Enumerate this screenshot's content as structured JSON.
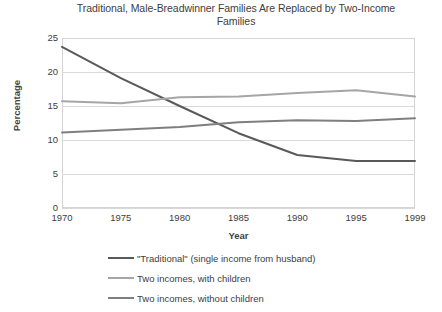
{
  "chart_data": {
    "type": "line",
    "title": "Traditional, Male-Breadwinner Families Are Replaced by Two-Income Families",
    "xlabel": "Year",
    "ylabel": "Percentage",
    "categories": [
      "1970",
      "1975",
      "1980",
      "1985",
      "1990",
      "1995",
      "1999"
    ],
    "ylim": [
      0,
      25
    ],
    "yticks": [
      "0",
      "5",
      "10",
      "15",
      "20",
      "25"
    ],
    "grid": true,
    "legend_position": "bottom",
    "series": [
      {
        "name": "\"Traditional\" (single income from husband)",
        "color": "#595959",
        "values": [
          23.7,
          19.1,
          15.0,
          11.0,
          7.8,
          6.9,
          6.9
        ]
      },
      {
        "name": "Two incomes, with children",
        "color": "#a6a6a6",
        "values": [
          15.7,
          15.4,
          16.3,
          16.4,
          16.9,
          17.3,
          16.4
        ]
      },
      {
        "name": "Two incomes, without children",
        "color": "#7f7f7f",
        "values": [
          11.1,
          11.5,
          11.9,
          12.6,
          12.9,
          12.8,
          13.2
        ]
      }
    ]
  }
}
